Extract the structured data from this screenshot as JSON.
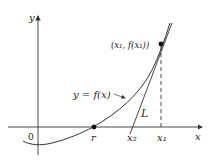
{
  "diagram": {
    "axes": {
      "x_label": "x",
      "y_label": "y",
      "origin_label": "0"
    },
    "curve_label": "y = f(x)",
    "point_label": "(x₁, f(x₁))",
    "tangent_label": "L",
    "x_ticks": [
      {
        "label": "r"
      },
      {
        "label": "x₂"
      },
      {
        "label": "x₁"
      }
    ],
    "colors": {
      "stroke": "#333333",
      "background": "#ffffff"
    }
  }
}
